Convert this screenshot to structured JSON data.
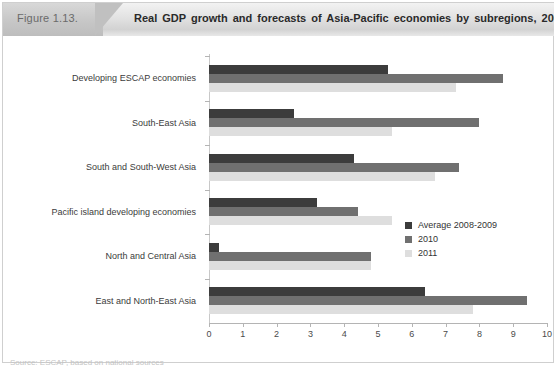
{
  "header": {
    "figure_number": "Figure 1.13.",
    "title": "Real GDP growth and forecasts of Asia-Pacific economies by subregions, 2008-2011"
  },
  "source_note": "Source: ESCAP, based on national sources",
  "legend": {
    "position": "middle-right",
    "entries": [
      {
        "label": "Average 2008-2009",
        "color": "#3c3c3c",
        "swatch_name": "legend-swatch-average"
      },
      {
        "label": "2010",
        "color": "#707070",
        "swatch_name": "legend-swatch-2010"
      },
      {
        "label": "2011",
        "color": "#dedede",
        "swatch_name": "legend-swatch-2011"
      }
    ]
  },
  "axis": {
    "x_ticks": [
      "0",
      "1",
      "2",
      "3",
      "4",
      "5",
      "6",
      "7",
      "8",
      "9",
      "10"
    ]
  },
  "chart_data": {
    "type": "bar",
    "orientation": "horizontal",
    "title": "Real GDP growth and forecasts of Asia-Pacific economies by subregions, 2008-2011",
    "xlabel": "",
    "ylabel": "",
    "xlim": [
      0,
      10
    ],
    "xticks": [
      0,
      1,
      2,
      3,
      4,
      5,
      6,
      7,
      8,
      9,
      10
    ],
    "grid": false,
    "legend_position": "middle-right",
    "categories": [
      "Developing ESCAP economies",
      "South-East Asia",
      "South and South-West Asia",
      "Pacific island developing economies",
      "North and Central Asia",
      "East and North-East Asia"
    ],
    "series": [
      {
        "name": "Average 2008-2009",
        "color": "#3c3c3c",
        "values": [
          5.3,
          2.5,
          4.3,
          3.2,
          0.3,
          6.4
        ]
      },
      {
        "name": "2010",
        "color": "#707070",
        "values": [
          8.7,
          8.0,
          7.4,
          4.4,
          4.8,
          9.4
        ]
      },
      {
        "name": "2011",
        "color": "#dedede",
        "values": [
          7.3,
          5.4,
          6.7,
          5.4,
          4.8,
          7.8
        ]
      }
    ]
  }
}
